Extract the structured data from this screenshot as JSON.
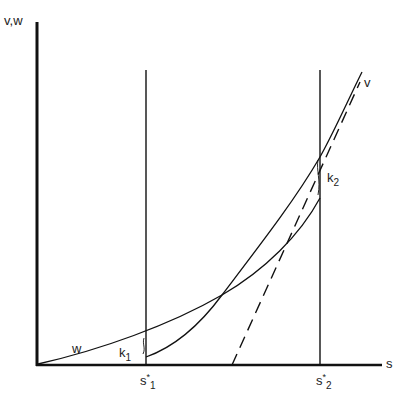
{
  "axes": {
    "y_label": "v,w",
    "x_label": "s"
  },
  "curves": {
    "v_label": "v",
    "w_label": "w"
  },
  "markers": {
    "s1_base": "s",
    "s1_star": "*",
    "s1_sub": "1",
    "s2_base": "s",
    "s2_star": "*",
    "s2_sub": "2"
  },
  "gaps": {
    "k1_base": "k",
    "k1_sub": "1",
    "k2_base": "k",
    "k2_sub": "2"
  }
}
